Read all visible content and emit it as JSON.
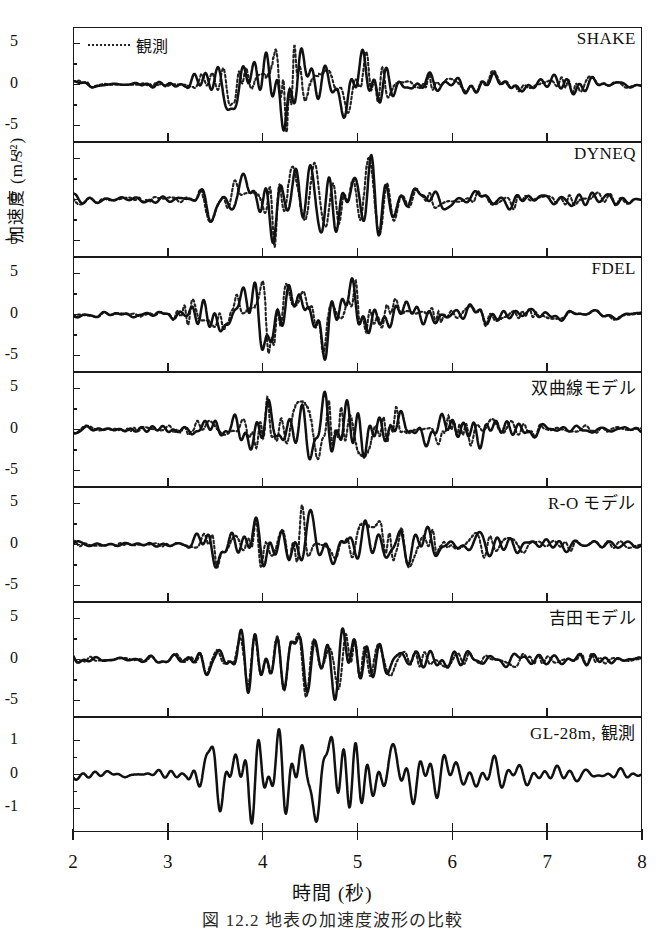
{
  "figure": {
    "ylabel": "加速度 (m/s²)",
    "xlabel": "時間 (秒)",
    "caption": "図 12.2  地表の加速度波形の比較",
    "legend": {
      "symbol": "dotted-line",
      "label": "観測"
    },
    "line_colors": {
      "computed": "#111111",
      "observed": "#222222"
    }
  },
  "chart_data": {
    "type": "line",
    "xlabel": "時間 (秒)",
    "ylabel": "加速度 (m/s²)",
    "xlim": [
      2,
      8
    ],
    "xticks": [
      2,
      3,
      4,
      5,
      6,
      7,
      8
    ],
    "grid": false,
    "legend_position": "top-left",
    "series_styles": [
      {
        "name": "計算",
        "style": "solid",
        "width": 2.4
      },
      {
        "name": "観測",
        "style": "dotted",
        "width": 2.2
      }
    ],
    "panels": [
      {
        "label": "SHAKE",
        "ylim": [
          -7,
          7
        ],
        "yticks": [
          5,
          0,
          -5
        ],
        "has_observed": true,
        "seed": 11,
        "peak_positive": 5.6,
        "peak_negative": -5.6,
        "series": [
          {
            "name": "計算",
            "style": "solid"
          },
          {
            "name": "観測",
            "style": "dotted"
          }
        ]
      },
      {
        "label": "DYNEQ",
        "ylim": [
          -7,
          7
        ],
        "yticks": [
          5,
          0,
          -5
        ],
        "has_observed": true,
        "seed": 23,
        "peak_positive": 5.4,
        "peak_negative": -5.2,
        "series": [
          {
            "name": "計算",
            "style": "solid"
          },
          {
            "name": "観測",
            "style": "dotted"
          }
        ]
      },
      {
        "label": "FDEL",
        "ylim": [
          -7,
          7
        ],
        "yticks": [
          5,
          0,
          -5
        ],
        "has_observed": true,
        "seed": 37,
        "peak_positive": 5.5,
        "peak_negative": -5.0,
        "series": [
          {
            "name": "計算",
            "style": "solid"
          },
          {
            "name": "観測",
            "style": "dotted"
          }
        ]
      },
      {
        "label": "双曲線モデル",
        "ylim": [
          -7,
          7
        ],
        "yticks": [
          5,
          0,
          -5
        ],
        "has_observed": true,
        "seed": 53,
        "peak_positive": 4.3,
        "peak_negative": -4.6,
        "series": [
          {
            "name": "計算",
            "style": "solid"
          },
          {
            "name": "観測",
            "style": "dotted"
          }
        ]
      },
      {
        "label": "R-O モデル",
        "ylim": [
          -7,
          7
        ],
        "yticks": [
          5,
          0,
          -5
        ],
        "has_observed": true,
        "seed": 71,
        "peak_positive": 3.8,
        "peak_negative": -4.2,
        "series": [
          {
            "name": "計算",
            "style": "solid"
          },
          {
            "name": "観測",
            "style": "dotted"
          }
        ]
      },
      {
        "label": "吉田モデル",
        "ylim": [
          -7,
          7
        ],
        "yticks": [
          5,
          0,
          -5
        ],
        "has_observed": true,
        "seed": 89,
        "peak_positive": 4.8,
        "peak_negative": -4.9,
        "series": [
          {
            "name": "計算",
            "style": "solid"
          },
          {
            "name": "観測",
            "style": "dotted"
          }
        ]
      },
      {
        "label": "GL-28m, 観測",
        "ylim": [
          -1.7,
          1.7
        ],
        "yticks": [
          1,
          0,
          -1
        ],
        "has_observed": false,
        "seed": 101,
        "peak_positive": 1.45,
        "peak_negative": -1.35,
        "series": [
          {
            "name": "入力観測波",
            "style": "solid"
          }
        ]
      }
    ]
  }
}
